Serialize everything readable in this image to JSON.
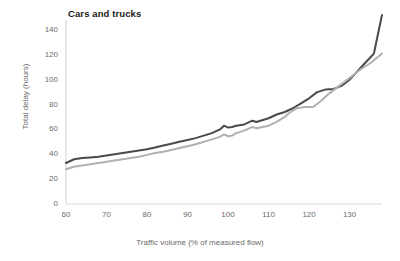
{
  "chart_data": {
    "type": "line",
    "title": "Cars and trucks",
    "xlabel": "Traffic volume (% of measured flow)",
    "ylabel": "Total delay (hours)",
    "xlim": [
      60,
      138
    ],
    "ylim": [
      0,
      148
    ],
    "grid": false,
    "legend": "none",
    "xticks": [
      60,
      70,
      80,
      90,
      100,
      110,
      120,
      130
    ],
    "xtick_labels": [
      "60",
      "70",
      "80",
      "90",
      "100",
      "110",
      "120",
      "130"
    ],
    "yticks": [
      0,
      20,
      40,
      60,
      80,
      100,
      120,
      140
    ],
    "ytick_labels": [
      "0",
      "20",
      "40",
      "60",
      "80",
      "100",
      "120",
      "140"
    ],
    "series": [
      {
        "name": "upper-series",
        "color": "#4a4a4a",
        "x": [
          60,
          62,
          64,
          66,
          68,
          70,
          72,
          74,
          76,
          78,
          80,
          82,
          84,
          86,
          88,
          90,
          92,
          94,
          96,
          98,
          99,
          100,
          101,
          102,
          104,
          106,
          107,
          108,
          110,
          112,
          114,
          116,
          118,
          120,
          122,
          124,
          126,
          128,
          130,
          132,
          134,
          136,
          138
        ],
        "values": [
          33,
          36,
          37,
          37.5,
          38,
          39,
          40,
          41,
          42,
          43,
          44,
          45.5,
          47,
          48.5,
          50,
          51.5,
          53,
          55,
          57,
          60,
          63,
          61.5,
          62,
          63,
          64,
          67,
          66,
          67,
          69,
          72,
          74,
          77,
          81,
          85,
          90,
          92,
          92.5,
          95,
          100,
          107,
          114,
          121,
          152
        ]
      },
      {
        "name": "lower-series",
        "color": "#b0b0b0",
        "x": [
          60,
          62,
          64,
          66,
          68,
          70,
          72,
          74,
          76,
          78,
          80,
          82,
          84,
          86,
          88,
          90,
          92,
          94,
          96,
          98,
          99,
          100,
          101,
          102,
          104,
          106,
          107,
          108,
          110,
          112,
          114,
          115,
          117,
          119,
          120,
          121,
          123,
          125,
          127,
          129,
          131,
          133,
          135,
          138
        ],
        "values": [
          28,
          30,
          31,
          32,
          33,
          34,
          35,
          36,
          37,
          38,
          39.5,
          41,
          42,
          43.5,
          45,
          46.5,
          48,
          50,
          52,
          54,
          56,
          54.5,
          55,
          57,
          59,
          62,
          61,
          61.5,
          63,
          66,
          70,
          73,
          77,
          78,
          78,
          78,
          83,
          89,
          94,
          99,
          104,
          109,
          113,
          121
        ]
      }
    ]
  }
}
